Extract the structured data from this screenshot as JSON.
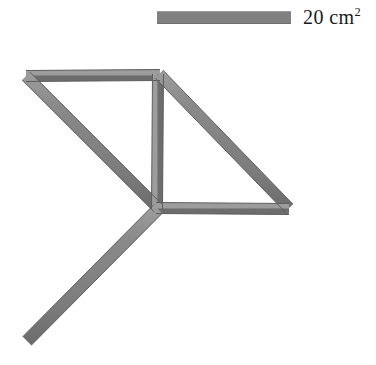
{
  "figure": {
    "type": "structural-truss-diagram",
    "background_color": "#ffffff",
    "member_fill_color": "#808080",
    "member_edge_color": "#5d5d5d",
    "member_highlight_color": "#9d9d9d"
  },
  "legend": {
    "swatch_name": "area-legend-swatch",
    "swatch_color": "#808080",
    "value": "20",
    "unit": "cm",
    "exponent": "2",
    "label": "20 cm²"
  },
  "structure": {
    "member_width_px": 11,
    "nodes": [
      {
        "id": "top-left",
        "label": "top-left-node",
        "x": 26,
        "y": 76
      },
      {
        "id": "top-right",
        "label": "top-right-node",
        "x": 158,
        "y": 75
      },
      {
        "id": "center",
        "label": "center-node",
        "x": 157,
        "y": 208
      },
      {
        "id": "right",
        "label": "right-node",
        "x": 288,
        "y": 208
      },
      {
        "id": "bottom-left",
        "label": "bottom-left-node",
        "x": 27,
        "y": 341
      }
    ],
    "members": [
      {
        "id": "top-chord",
        "name": "member-top-chord",
        "from": "top-left",
        "to": "top-right",
        "x1": 26,
        "y1": 76,
        "x2": 160,
        "y2": 75
      },
      {
        "id": "left-diagonal",
        "name": "member-left-diagonal",
        "from": "top-left",
        "to": "center",
        "x1": 26,
        "y1": 76,
        "x2": 158,
        "y2": 208
      },
      {
        "id": "vertical-post",
        "name": "member-vertical-post",
        "from": "top-right",
        "to": "center",
        "x1": 158,
        "y1": 74,
        "x2": 157,
        "y2": 209
      },
      {
        "id": "right-diagonal",
        "name": "member-right-diagonal",
        "from": "top-right",
        "to": "right",
        "x1": 159,
        "y1": 74,
        "x2": 289,
        "y2": 208
      },
      {
        "id": "bottom-chord",
        "name": "member-bottom-chord",
        "from": "center",
        "to": "right",
        "x1": 156,
        "y1": 208,
        "x2": 289,
        "y2": 209
      },
      {
        "id": "lower-left-diagonal",
        "name": "member-lower-left-diagonal",
        "from": "center",
        "to": "bottom-left",
        "x1": 158,
        "y1": 209,
        "x2": 27,
        "y2": 341
      }
    ]
  }
}
